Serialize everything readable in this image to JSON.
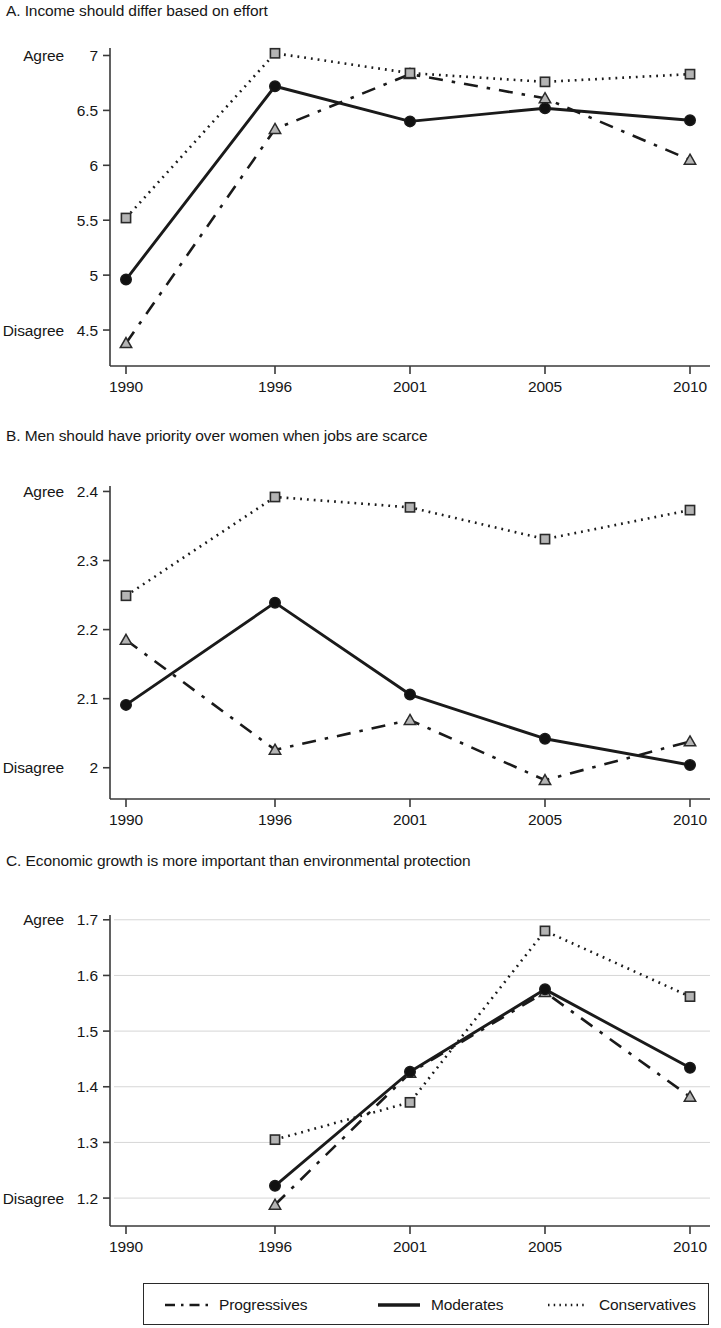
{
  "figure": {
    "panels": [
      {
        "id": "A",
        "title": "A. Income should differ based on effort",
        "y_high_label": "Agree",
        "y_low_label": "Disagree",
        "y_ticks": [
          "4.5",
          "5",
          "5.5",
          "6",
          "6.5",
          "7"
        ],
        "y_tick_values": [
          4.5,
          5,
          5.5,
          6,
          6.5,
          7
        ],
        "x_ticks": [
          "1990",
          "1996",
          "2001",
          "2005",
          "2010"
        ],
        "gridlines": false
      },
      {
        "id": "B",
        "title": "B. Men should have priority over women when jobs are scarce",
        "y_high_label": "Agree",
        "y_low_label": "Disagree",
        "y_ticks": [
          "2",
          "2.1",
          "2.2",
          "2.3",
          "2.4"
        ],
        "y_tick_values": [
          2.0,
          2.1,
          2.2,
          2.3,
          2.4
        ],
        "x_ticks": [
          "1990",
          "1996",
          "2001",
          "2005",
          "2010"
        ],
        "gridlines": false
      },
      {
        "id": "C",
        "title": "C. Economic growth is more important than environmental protection",
        "y_high_label": "Agree",
        "y_low_label": "Disagree",
        "y_ticks": [
          "1.2",
          "1.3",
          "1.4",
          "1.5",
          "1.6",
          "1.7"
        ],
        "y_tick_values": [
          1.2,
          1.3,
          1.4,
          1.5,
          1.6,
          1.7
        ],
        "x_ticks": [
          "1990",
          "1996",
          "2001",
          "2005",
          "2010"
        ],
        "gridlines": true
      }
    ],
    "legend": {
      "items": [
        {
          "label": "Progressives",
          "style": "dashed",
          "marker": "triangle"
        },
        {
          "label": "Moderates",
          "style": "solid",
          "marker": "circle"
        },
        {
          "label": "Conservatives",
          "style": "dotted",
          "marker": "square"
        }
      ]
    },
    "colors": {
      "line": "#1a1a1a",
      "grid": "#d6d6d6",
      "axis": "#3a3a3a",
      "marker_fill_open": "#b4b4b4",
      "marker_fill_solid": "#111111",
      "background": "#ffffff"
    }
  },
  "chart_data": [
    {
      "type": "line",
      "panel": "A",
      "title": "A. Income should differ based on effort",
      "xlabel": "",
      "ylabel": "",
      "x": [
        1990,
        1996,
        2001,
        2005,
        2010
      ],
      "categories": [
        "1990",
        "1996",
        "2001",
        "2005",
        "2010"
      ],
      "ylim": [
        4.3,
        7.05
      ],
      "yticks": [
        4.5,
        5,
        5.5,
        6,
        6.5,
        7
      ],
      "y_axis_high_label": "Agree",
      "y_axis_low_label": "Disagree",
      "grid": false,
      "legend_position": "bottom",
      "series": [
        {
          "name": "Progressives",
          "values": [
            4.38,
            6.33,
            6.83,
            6.61,
            6.05
          ]
        },
        {
          "name": "Moderates",
          "values": [
            4.96,
            6.72,
            6.4,
            6.52,
            6.41
          ]
        },
        {
          "name": "Conservatives",
          "values": [
            5.52,
            7.02,
            6.84,
            6.76,
            6.83
          ]
        }
      ]
    },
    {
      "type": "line",
      "panel": "B",
      "title": "B. Men should have priority over women when jobs are scarce",
      "xlabel": "",
      "ylabel": "",
      "x": [
        1990,
        1996,
        2001,
        2005,
        2010
      ],
      "categories": [
        "1990",
        "1996",
        "2001",
        "2005",
        "2010"
      ],
      "ylim": [
        1.975,
        2.405
      ],
      "yticks": [
        2.0,
        2.1,
        2.2,
        2.3,
        2.4
      ],
      "y_axis_high_label": "Agree",
      "y_axis_low_label": "Disagree",
      "grid": false,
      "legend_position": "bottom",
      "series": [
        {
          "name": "Progressives",
          "values": [
            2.185,
            2.026,
            2.069,
            1.982,
            2.038
          ]
        },
        {
          "name": "Moderates",
          "values": [
            2.091,
            2.239,
            2.106,
            2.042,
            2.004
          ]
        },
        {
          "name": "Conservatives",
          "values": [
            2.249,
            2.392,
            2.377,
            2.331,
            2.373
          ]
        }
      ]
    },
    {
      "type": "line",
      "panel": "C",
      "title": "C. Economic growth is more important than environmental protection",
      "xlabel": "",
      "ylabel": "",
      "x": [
        1996,
        2001,
        2005,
        2010
      ],
      "categories": [
        "1990",
        "1996",
        "2001",
        "2005",
        "2010"
      ],
      "ylim": [
        1.175,
        1.705
      ],
      "yticks": [
        1.2,
        1.3,
        1.4,
        1.5,
        1.6,
        1.7
      ],
      "y_axis_high_label": "Agree",
      "y_axis_low_label": "Disagree",
      "grid": true,
      "legend_position": "bottom",
      "note": "No 1990 observations; series begin at 1996",
      "series": [
        {
          "name": "Progressives",
          "values": [
            1.188,
            1.425,
            1.57,
            1.382
          ]
        },
        {
          "name": "Moderates",
          "values": [
            1.222,
            1.427,
            1.575,
            1.434
          ]
        },
        {
          "name": "Conservatives",
          "values": [
            1.305,
            1.372,
            1.68,
            1.562
          ]
        }
      ]
    }
  ]
}
